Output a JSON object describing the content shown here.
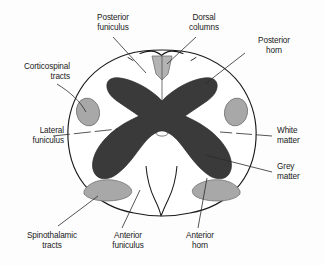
{
  "figure": {
    "type": "anatomical-cross-section",
    "background_color": "#fdfdfd",
    "outline_color": "#1a1a1a",
    "leader_line_color": "#2b2b2b"
  },
  "regions": {
    "grey_matter": {
      "name": "Grey matter",
      "color": "#3a3a3a",
      "shape": "butterfly"
    },
    "white_matter": {
      "name": "White matter",
      "color": "#ffffff"
    },
    "dorsal_columns": {
      "name": "Dorsal columns",
      "color": "#b3b3b3",
      "shape": "wedge"
    },
    "corticospinal_tracts": {
      "name": "Corticospinal tracts",
      "color": "#a8a8a8",
      "shape": "oval",
      "count": 2
    },
    "spinothalamic_tracts": {
      "name": "Spinothalamic tracts",
      "color": "#a8a8a8",
      "shape": "band",
      "count": 2
    },
    "central_canal": {
      "name": "Central canal",
      "color": "#ffffff"
    }
  },
  "labels": [
    {
      "id": "posterior-funiculus",
      "text": "Posterior\nfuniculus",
      "align": "center"
    },
    {
      "id": "dorsal-columns",
      "text": "Dorsal\ncolumns",
      "align": "center"
    },
    {
      "id": "posterior-horn",
      "text": "Posterior\nhorn",
      "align": "center"
    },
    {
      "id": "corticospinal-tracts",
      "text": "Corticospinal\ntracts",
      "align": "right"
    },
    {
      "id": "lateral-funiculus",
      "text": "Lateral\nfuniculus",
      "align": "right"
    },
    {
      "id": "white-matter",
      "text": "White\nmatter",
      "align": "left"
    },
    {
      "id": "grey-matter",
      "text": "Grey\nmatter",
      "align": "left"
    },
    {
      "id": "spinothalamic-tracts",
      "text": "Spinothalamic\ntracts",
      "align": "center"
    },
    {
      "id": "anterior-funiculus",
      "text": "Anterior\nfuniculus",
      "align": "center"
    },
    {
      "id": "anterior-horn",
      "text": "Anterior\nhorn",
      "align": "center"
    }
  ]
}
